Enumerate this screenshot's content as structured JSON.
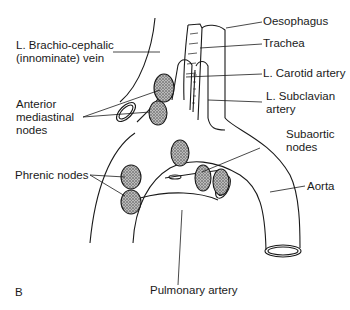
{
  "figure": {
    "panel_label": "B",
    "labels": {
      "oesophagus": "Oesophagus",
      "trachea": "Trachea",
      "brachiocephalic_1": "L. Brachio-cephalic",
      "brachiocephalic_2": "(innominate) vein",
      "carotid": "L. Carotid artery",
      "subclavian_1": "L. Subclavian",
      "subclavian_2": "artery",
      "anterior_1": "Anterior",
      "anterior_2": "mediastinal",
      "anterior_3": "nodes",
      "subaortic_1": "Subaortic",
      "subaortic_2": "nodes",
      "phrenic": "Phrenic nodes",
      "aorta": "Aorta",
      "pulmonary": "Pulmonary artery"
    },
    "colors": {
      "line": "#1a1a1a",
      "node_fill": "#9a9a9a"
    }
  }
}
